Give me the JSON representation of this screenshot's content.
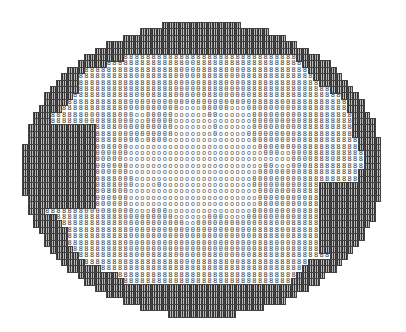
{
  "figure": {
    "type": "line-printer ASCII contour map",
    "shape": "ellipse",
    "ellipse": {
      "cx": 202,
      "cy": 169,
      "rx": 180,
      "ry": 147
    },
    "grid": {
      "cols": 64,
      "rows": 46,
      "cell_w": 5.6,
      "cell_h": 6.4
    },
    "levels": [
      {
        "id": 0,
        "symbol": "█",
        "description": "dense overprint (outer rim)",
        "color": "#2a2a2a"
      },
      {
        "id": 1,
        "symbol": "8",
        "description": "dark ring symbol",
        "color": "#333333"
      },
      {
        "id": 2,
        "symbol": "0",
        "description": "medium symbol",
        "color": "#444444"
      },
      {
        "id": 3,
        "symbol": "o",
        "description": "light center symbol",
        "color": "#555555"
      }
    ],
    "background": "#ffffff"
  }
}
